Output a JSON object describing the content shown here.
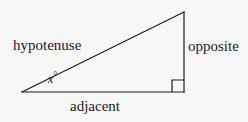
{
  "figure": {
    "background_color": "#f7f7f8",
    "stroke_color": "#1c1c1c",
    "text_color": "#1c1c1c",
    "stroke_width": 1.2
  },
  "labels": {
    "hypotenuse": "hypotenuse",
    "opposite": "opposite",
    "adjacent": "adjacent",
    "angle_variable": "x",
    "angle_degree_symbol": "°"
  },
  "geometry": {
    "vertices": {
      "left": [
        22,
        92
      ],
      "bottom_right": [
        184,
        92
      ],
      "top_right": [
        184,
        12
      ]
    },
    "right_angle_marker": {
      "corner": [
        184,
        92
      ],
      "size": 12
    }
  }
}
